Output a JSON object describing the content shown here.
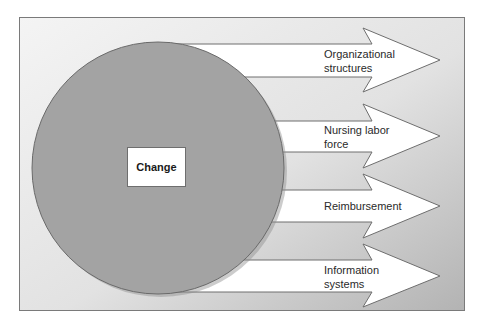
{
  "diagram": {
    "center": {
      "label": "Change"
    },
    "outcomes": [
      {
        "label": "Organizational\nstructures",
        "line1": "Organizational",
        "line2": "structures"
      },
      {
        "label": "Nursing labor\nforce",
        "line1": "Nursing labor",
        "line2": "force"
      },
      {
        "label": "Reimbursement",
        "line1": "Reimbursement",
        "line2": ""
      },
      {
        "label": "Information\nsystems",
        "line1": "Information",
        "line2": "systems"
      }
    ],
    "colors": {
      "frame_border": "#7a7a7a",
      "circle_fill": "#a3a3a3",
      "circle_border": "#6a6a6a",
      "arrow_fill": "#ffffff",
      "arrow_border": "#6e6e6e",
      "background_light": "#f2f2f2",
      "background_dark": "#b8b8b8"
    }
  }
}
